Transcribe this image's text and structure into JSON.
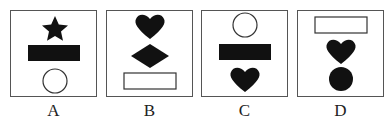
{
  "options": [
    {
      "label": "A",
      "shapes": [
        "star-filled",
        "rectangle-filled",
        "circle-outline"
      ]
    },
    {
      "label": "B",
      "shapes": [
        "heart-filled",
        "diamond-filled",
        "rectangle-outline"
      ]
    },
    {
      "label": "C",
      "shapes": [
        "circle-outline",
        "rectangle-filled",
        "heart-filled"
      ]
    },
    {
      "label": "D",
      "shapes": [
        "rectangle-outline",
        "heart-filled",
        "circle-filled"
      ]
    }
  ],
  "colors": {
    "fill": "#111111",
    "stroke": "#333333",
    "border": "#555555"
  }
}
